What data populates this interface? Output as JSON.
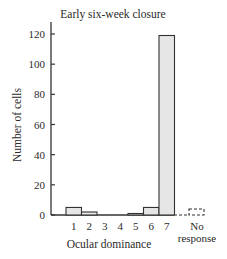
{
  "chart_data": {
    "type": "bar",
    "title": "Early six-week closure",
    "xlabel": "Ocular dominance",
    "ylabel": "Number of cells",
    "categories": [
      "1",
      "2",
      "3",
      "4",
      "5",
      "6",
      "7"
    ],
    "values": [
      5,
      2,
      0,
      0,
      1,
      5,
      119
    ],
    "extra_category": {
      "label_line1": "No",
      "label_line2": "response",
      "value": 0,
      "style": "dashed"
    },
    "yticks": [
      0,
      20,
      40,
      60,
      80,
      100,
      120
    ],
    "ylim": [
      0,
      125
    ],
    "grid": false,
    "legend": null,
    "colors": {
      "bar_fill": "#e6e6e6",
      "bar_stroke": "#333333",
      "axis": "#333333"
    }
  }
}
